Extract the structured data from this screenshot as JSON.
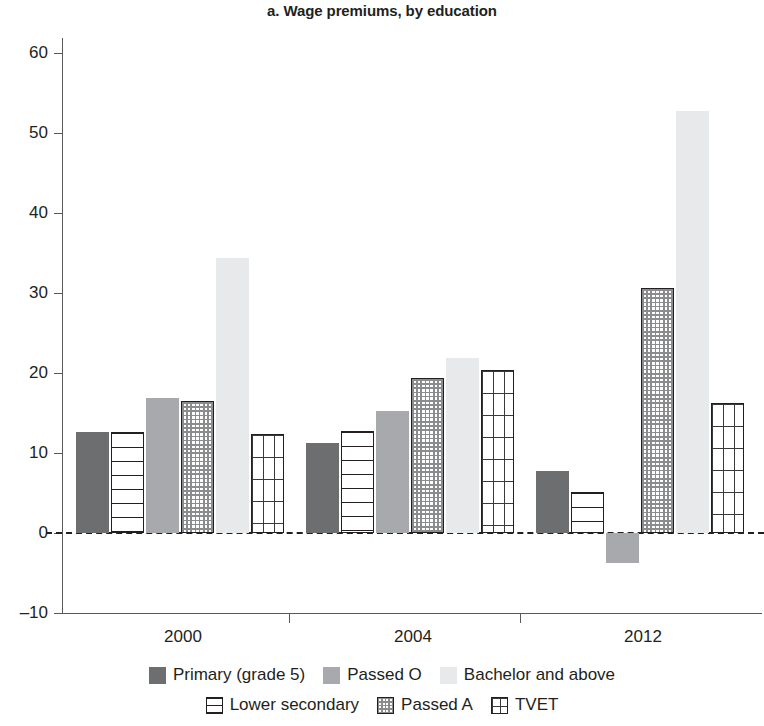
{
  "chart_data": {
    "type": "bar",
    "title": "a. Wage premiums, by education",
    "xlabel": "",
    "ylabel": "",
    "categories": [
      "2000",
      "2004",
      "2012"
    ],
    "ylim": [
      -10,
      60
    ],
    "yticks": [
      -10,
      0,
      10,
      20,
      30,
      40,
      50,
      60
    ],
    "ytick_labels": [
      "–10",
      "0",
      "10",
      "20",
      "30",
      "40",
      "50",
      "60"
    ],
    "grid": false,
    "zero_line": true,
    "legend_position": "bottom",
    "series": [
      {
        "name": "Primary (grade 5)",
        "pattern": "solid-dark",
        "color": "#6d6e70",
        "values": [
          12.6,
          11.3,
          7.8
        ]
      },
      {
        "name": "Lower secondary",
        "pattern": "hlines",
        "color": "#ffffff",
        "values": [
          12.6,
          12.7,
          5.1
        ]
      },
      {
        "name": "Passed O",
        "pattern": "solid-mid",
        "color": "#a7a9ac",
        "values": [
          16.9,
          15.3,
          -3.7
        ]
      },
      {
        "name": "Passed A",
        "pattern": "checker",
        "color": "#ffffff",
        "values": [
          16.5,
          19.4,
          30.6
        ]
      },
      {
        "name": "Bachelor and above",
        "pattern": "solid-light",
        "color": "#e8e9ea",
        "values": [
          34.4,
          21.9,
          52.8
        ]
      },
      {
        "name": "TVET",
        "pattern": "grid",
        "color": "#ffffff",
        "values": [
          12.4,
          20.4,
          16.3
        ]
      }
    ]
  },
  "legend": {
    "items": [
      {
        "label": "Primary (grade 5)",
        "pattern": "p-solid-dark"
      },
      {
        "label": "Passed O",
        "pattern": "p-solid-mid"
      },
      {
        "label": "Bachelor and above",
        "pattern": "p-solid-light"
      },
      {
        "label": "Lower secondary",
        "pattern": "p-hlines"
      },
      {
        "label": "Passed A",
        "pattern": "p-checker"
      },
      {
        "label": "TVET",
        "pattern": "p-grid"
      }
    ]
  }
}
